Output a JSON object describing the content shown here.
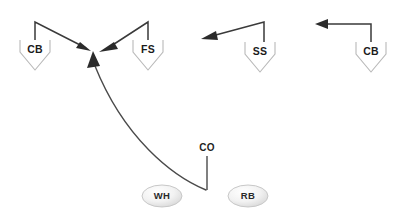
{
  "diagram": {
    "background_color": "#ffffff",
    "line_color": "#3a3a3a",
    "symbol_outline_color": "#b9b9b9",
    "label_color": "#1b1b1b"
  },
  "defenders": [
    {
      "id": "cb-left",
      "label": "CB",
      "x": 35,
      "y": 50,
      "symbol": "chevron-down"
    },
    {
      "id": "fs",
      "label": "FS",
      "x": 148,
      "y": 50,
      "symbol": "chevron-down"
    },
    {
      "id": "ss",
      "label": "SS",
      "x": 260,
      "y": 50,
      "symbol": "chevron-down"
    },
    {
      "id": "cb-right",
      "label": "CB",
      "x": 371,
      "y": 50,
      "symbol": "chevron-down"
    }
  ],
  "offense": [
    {
      "id": "wh",
      "label": "WH",
      "x": 162,
      "y": 196,
      "symbol": "ellipse"
    },
    {
      "id": "rb",
      "label": "RB",
      "x": 248,
      "y": 196,
      "symbol": "ellipse"
    }
  ],
  "route_labels": [
    {
      "id": "co",
      "label": "CO",
      "x": 207,
      "y": 148
    }
  ],
  "convergence_point": {
    "x": 94,
    "y": 54
  },
  "motion_paths": [
    {
      "id": "cb-left-path",
      "from": "cb-left",
      "to": "convergence-point",
      "kind": "straight",
      "points": "35,40 35,22 88,49"
    },
    {
      "id": "fs-path",
      "from": "fs",
      "to": "convergence-point",
      "kind": "straight",
      "points": "148,40 148,22 106,49"
    },
    {
      "id": "ss-path",
      "from": "ss",
      "to": "left-sideline",
      "kind": "straight",
      "points": "264,42 264,22 208,37"
    },
    {
      "id": "cb-right-path",
      "from": "cb-right",
      "to": "left",
      "kind": "straight",
      "points": "371,42 371,24 322,24"
    },
    {
      "id": "wh-co-route",
      "from": "co-stem",
      "to": "convergence-point",
      "kind": "curve",
      "points": "206,190 C 176,178 128,140 96,66"
    },
    {
      "id": "co-stem-line",
      "from": "co-label",
      "to": "route-start",
      "kind": "straight",
      "points": "207,156 207,190"
    }
  ]
}
